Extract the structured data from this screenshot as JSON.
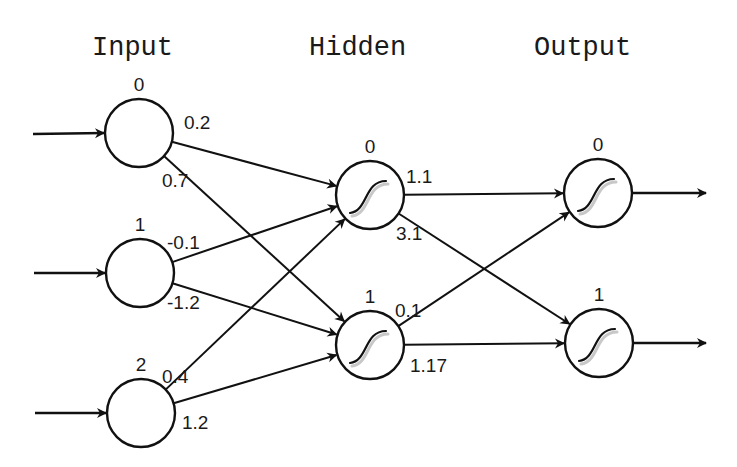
{
  "diagram": {
    "type": "feedforward-neural-network",
    "layers": [
      {
        "id": "input",
        "title": "Input",
        "title_pos": [
          92,
          55
        ],
        "activation": "none",
        "nodes": [
          {
            "index": "0",
            "cx": 139,
            "cy": 133
          },
          {
            "index": "1",
            "cx": 140,
            "cy": 273
          },
          {
            "index": "2",
            "cx": 141,
            "cy": 413
          }
        ]
      },
      {
        "id": "hidden",
        "title": "Hidden",
        "title_pos": [
          309,
          55
        ],
        "activation": "sigmoid",
        "nodes": [
          {
            "index": "0",
            "cx": 370,
            "cy": 195
          },
          {
            "index": "1",
            "cx": 370,
            "cy": 345
          }
        ]
      },
      {
        "id": "output",
        "title": "Output",
        "title_pos": [
          534,
          55
        ],
        "activation": "sigmoid",
        "nodes": [
          {
            "index": "0",
            "cx": 598,
            "cy": 193
          },
          {
            "index": "1",
            "cx": 599,
            "cy": 343
          }
        ]
      }
    ],
    "node_radius": 34,
    "edges": [
      {
        "from": "input.0",
        "to": "hidden.0",
        "weight": "0.2",
        "label_pos": [
          184,
          129
        ]
      },
      {
        "from": "input.0",
        "to": "hidden.1",
        "weight": "0.7",
        "label_pos": [
          162,
          187
        ]
      },
      {
        "from": "input.1",
        "to": "hidden.0",
        "weight": "-0.1",
        "label_pos": [
          167,
          249
        ]
      },
      {
        "from": "input.1",
        "to": "hidden.1",
        "weight": "-1.2",
        "label_pos": [
          167,
          309
        ]
      },
      {
        "from": "input.2",
        "to": "hidden.0",
        "weight": "0.4",
        "label_pos": [
          162,
          383
        ]
      },
      {
        "from": "input.2",
        "to": "hidden.1",
        "weight": "1.2",
        "label_pos": [
          182,
          429
        ]
      },
      {
        "from": "hidden.0",
        "to": "output.0",
        "weight": "1.1",
        "label_pos": [
          406,
          183
        ]
      },
      {
        "from": "hidden.0",
        "to": "output.1",
        "weight": "3.1",
        "label_pos": [
          396,
          240
        ]
      },
      {
        "from": "hidden.1",
        "to": "output.0",
        "weight": "0.1",
        "label_pos": [
          395,
          317
        ]
      },
      {
        "from": "hidden.1",
        "to": "output.1",
        "weight": "1.17",
        "label_pos": [
          410,
          372
        ]
      }
    ],
    "input_arrows": [
      {
        "x1": 33,
        "y1": 134,
        "to": "input.0"
      },
      {
        "x1": 34,
        "y1": 273,
        "to": "input.1"
      },
      {
        "x1": 35,
        "y1": 413,
        "to": "input.2"
      }
    ],
    "output_arrows": [
      {
        "from": "output.0",
        "x2": 706,
        "y2": 193
      },
      {
        "from": "output.1",
        "x2": 706,
        "y2": 343
      }
    ],
    "colors": {
      "stroke": "#111111",
      "text": "#1a1a1a",
      "background": "#ffffff"
    }
  }
}
